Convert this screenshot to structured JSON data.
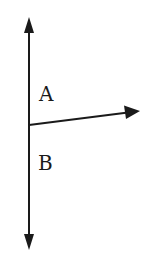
{
  "diagram": {
    "type": "vector-diagram",
    "colors": {
      "stroke": "#1a1a1a",
      "background": "#ffffff"
    },
    "labels": {
      "a": "A",
      "b": "B"
    },
    "elements": [
      {
        "id": "vertical-line",
        "kind": "double-headed-arrow",
        "from": [
          29,
          17
        ],
        "to": [
          29,
          250
        ]
      },
      {
        "id": "slanted-arrow",
        "kind": "arrow",
        "from": [
          29,
          125
        ],
        "to": [
          139,
          111
        ]
      }
    ]
  }
}
